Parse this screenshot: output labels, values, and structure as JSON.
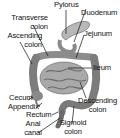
{
  "diagram": {
    "labels": {
      "pylorus": "Pylorus",
      "duodenum": "Duodenum",
      "transverse_colon_1": "Transverse",
      "transverse_colon_2": "colon",
      "jejunum": "Jejunum",
      "ascending_colon_1": "Ascending",
      "ascending_colon_2": "colon",
      "ileum": "Ileum",
      "cecum": "Cecum",
      "appendix": "Appendix",
      "rectum": "Rectum",
      "descending_colon_1": "Descending",
      "descending_colon_2": "colon",
      "anal_canal_1": "Anal",
      "anal_canal_2": "canal",
      "sigmoid_colon_1": "Sigmoid",
      "sigmoid_colon_2": "colon"
    },
    "colors": {
      "organ_dark": "#6e6e6e",
      "organ_mid": "#9a9a9a",
      "organ_light": "#c4c4c4",
      "leader_line": "#111111"
    }
  }
}
